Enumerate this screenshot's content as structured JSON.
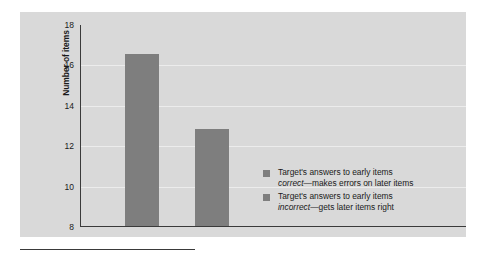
{
  "chart_data": {
    "type": "bar",
    "title": "",
    "subtitle": "",
    "xlabel": "",
    "ylabel": "Number of items",
    "ylim": [
      8,
      18
    ],
    "yticks": [
      8,
      10,
      12,
      14,
      16,
      18
    ],
    "ytick_labels": [
      "8",
      "10",
      "12",
      "14",
      "16",
      "18"
    ],
    "grid": true,
    "legend_position": "inside-right",
    "categories": [
      "Target's answers to early items correct",
      "Target's answers to early items incorrect"
    ],
    "values": [
      16.5,
      12.8
    ],
    "series": [
      {
        "name": "Number of items",
        "values": [
          16.5,
          12.8
        ],
        "color": "#7e7e7e"
      }
    ],
    "legend": [
      {
        "swatch_color": "#7e7e7e",
        "line1_prefix": "Target's answers to early items",
        "line2_emphasis": "correct",
        "line2_rest": "—makes errors on later items"
      },
      {
        "swatch_color": "#7e7e7e",
        "line1_prefix": "Target's answers to early items",
        "line2_emphasis": "incorrect",
        "line2_rest": "—gets later items right"
      }
    ],
    "colors": {
      "bar": "#7e7e7e",
      "panel_background": "#d9d9d9",
      "gridline": "#ececec",
      "axis": "#3a3a3a",
      "text": "#1a1a1a"
    }
  }
}
